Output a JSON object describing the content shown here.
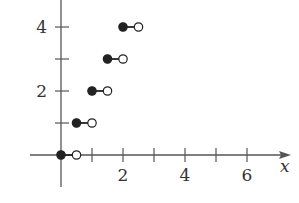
{
  "chart_data": {
    "type": "scatter",
    "subtype": "step-function",
    "title": "",
    "xlabel": "x",
    "ylabel": "",
    "xlim": [
      -1,
      7.5
    ],
    "ylim": [
      -1,
      4.8
    ],
    "grid": false,
    "legend": null,
    "x_ticks": [
      1,
      2,
      3,
      4,
      5,
      6
    ],
    "x_tick_labels": {
      "2": "2",
      "4": "4",
      "6": "6"
    },
    "y_ticks": [
      1,
      2,
      3,
      4
    ],
    "y_tick_labels": {
      "2": "2",
      "4": "4"
    },
    "segments": [
      {
        "x_start": 0.0,
        "x_end": 0.5,
        "y": 0,
        "start_closed": true,
        "end_closed": false
      },
      {
        "x_start": 0.5,
        "x_end": 1.0,
        "y": 1,
        "start_closed": true,
        "end_closed": false
      },
      {
        "x_start": 1.0,
        "x_end": 1.5,
        "y": 2,
        "start_closed": true,
        "end_closed": false
      },
      {
        "x_start": 1.5,
        "x_end": 2.0,
        "y": 3,
        "start_closed": true,
        "end_closed": false
      },
      {
        "x_start": 2.0,
        "x_end": 2.5,
        "y": 4,
        "start_closed": true,
        "end_closed": false
      }
    ]
  },
  "colors": {
    "axis": "#555555",
    "filled_point": "#222222",
    "open_point_fill": "#ffffff",
    "text": "#333333"
  }
}
